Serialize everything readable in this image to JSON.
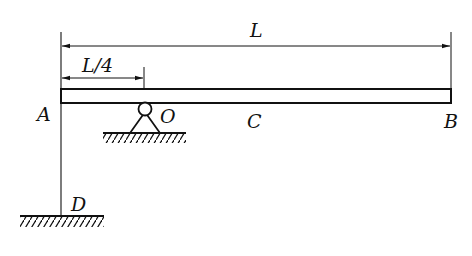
{
  "diagram": {
    "type": "mechanics-beam",
    "colors": {
      "stroke": "#111111",
      "background": "#ffffff"
    },
    "labels": {
      "total_length": "L",
      "quarter_length": "L/4",
      "point_a": "A",
      "point_o": "O",
      "point_c": "C",
      "point_b": "B",
      "point_d": "D"
    },
    "dimensions": [
      {
        "label": "L",
        "from": "A",
        "to": "B"
      },
      {
        "label": "L/4",
        "from": "A",
        "to": "O"
      }
    ],
    "supports": [
      {
        "type": "pin",
        "at": "O"
      },
      {
        "type": "fixed-ground",
        "at": "D"
      }
    ],
    "members": [
      {
        "name": "beam",
        "from": "A",
        "to": "B"
      },
      {
        "name": "rod",
        "from": "A",
        "to": "D"
      }
    ]
  }
}
